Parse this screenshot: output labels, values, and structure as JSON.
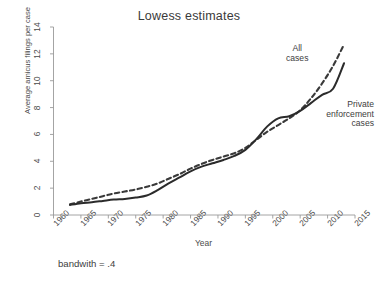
{
  "chart_data": {
    "type": "line",
    "title": "Lowess estimates",
    "xlabel": "Year",
    "ylabel": "Average amicus filings per case",
    "footnote": "bandwith = .4",
    "xlim": [
      1960,
      2015
    ],
    "ylim": [
      0,
      14
    ],
    "xticks": [
      "1960",
      "1965",
      "1970",
      "1975",
      "1980",
      "1985",
      "1990",
      "1995",
      "2000",
      "2005",
      "2010",
      "2015"
    ],
    "xtick_values": [
      1960,
      1965,
      1970,
      1975,
      1980,
      1985,
      1990,
      1995,
      2000,
      2005,
      2010,
      2015
    ],
    "yticks": [
      "0",
      "2",
      "4",
      "6",
      "8",
      "10",
      "12",
      "14"
    ],
    "ytick_values": [
      0,
      2,
      4,
      6,
      8,
      10,
      12,
      14
    ],
    "grid": false,
    "legend_position": "inline-annotations",
    "series": [
      {
        "name": "All cases",
        "style": "dashed",
        "color": "#3a3a3a",
        "annotation": "All\ncases",
        "annotation_line1": "All",
        "annotation_line2": "cases",
        "x": [
          1963,
          1965,
          1967,
          1969,
          1971,
          1973,
          1975,
          1977,
          1979,
          1981,
          1983,
          1985,
          1987,
          1989,
          1991,
          1993,
          1995,
          1997,
          1999,
          2001,
          2003,
          2005,
          2007,
          2009,
          2011,
          2013
        ],
        "values": [
          0.8,
          1.0,
          1.2,
          1.4,
          1.6,
          1.75,
          1.9,
          2.1,
          2.35,
          2.7,
          3.05,
          3.45,
          3.8,
          4.1,
          4.35,
          4.6,
          5.0,
          5.6,
          6.2,
          6.7,
          7.2,
          7.8,
          8.7,
          9.8,
          11.1,
          12.7
        ]
      },
      {
        "name": "Private enforcement cases",
        "style": "solid",
        "color": "#2b2b2b",
        "annotation": "Private\nenforcement\ncases",
        "annotation_line1": "Private",
        "annotation_line2": "enforcement",
        "annotation_line3": "cases",
        "x": [
          1963,
          1965,
          1967,
          1969,
          1971,
          1973,
          1975,
          1977,
          1979,
          1981,
          1983,
          1985,
          1987,
          1989,
          1991,
          1993,
          1995,
          1997,
          1999,
          2001,
          2003,
          2005,
          2007,
          2009,
          2011,
          2013
        ],
        "values": [
          0.75,
          0.88,
          0.95,
          1.05,
          1.15,
          1.2,
          1.3,
          1.45,
          1.85,
          2.35,
          2.8,
          3.25,
          3.6,
          3.85,
          4.1,
          4.4,
          4.85,
          5.65,
          6.6,
          7.2,
          7.35,
          7.75,
          8.35,
          8.95,
          9.4,
          11.3
        ]
      }
    ]
  }
}
